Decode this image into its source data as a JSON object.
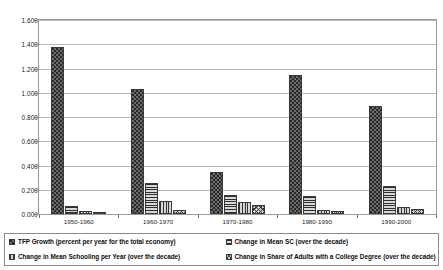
{
  "chart_data": {
    "type": "bar",
    "title": "",
    "xlabel": "",
    "ylabel": "",
    "categories": [
      "1950-1960",
      "1960-1970",
      "1970-1980",
      "1980-1990",
      "1990-2000"
    ],
    "ylim": [
      0.0,
      1.6
    ],
    "ytick_labels": [
      "1.600",
      "1.400",
      "1.200",
      "1.000",
      "0.800",
      "0.600",
      "0.400",
      "0.200",
      "0.000"
    ],
    "ytick_values": [
      1.6,
      1.4,
      1.2,
      1.0,
      0.8,
      0.6,
      0.4,
      0.2,
      0.0
    ],
    "grid": true,
    "legend_position": "bottom",
    "series": [
      {
        "name": "TFP Growth (percent per year for the total economy)",
        "pattern": "dotted-dark",
        "values": [
          1.375,
          1.03,
          0.35,
          1.15,
          0.89
        ]
      },
      {
        "name": "Change in Mean SC (over the decade)",
        "pattern": "horizontal-lines",
        "values": [
          0.065,
          0.255,
          0.16,
          0.145,
          0.23
        ]
      },
      {
        "name": "Change in Mean Schooling per Year (over the decade)",
        "pattern": "vertical-lines",
        "values": [
          0.025,
          0.105,
          0.1,
          0.03,
          0.06
        ]
      },
      {
        "name": "Change in Share of Adults with a College Degree (over the decade)",
        "pattern": "crosshatch-light",
        "values": [
          0.015,
          0.03,
          0.075,
          0.025,
          0.045
        ]
      }
    ]
  },
  "colors": {
    "plot_background": "#ffffff",
    "gridline": "#b8b8b8",
    "frame": "#9a9a9a",
    "text": "#1a1a1a"
  }
}
